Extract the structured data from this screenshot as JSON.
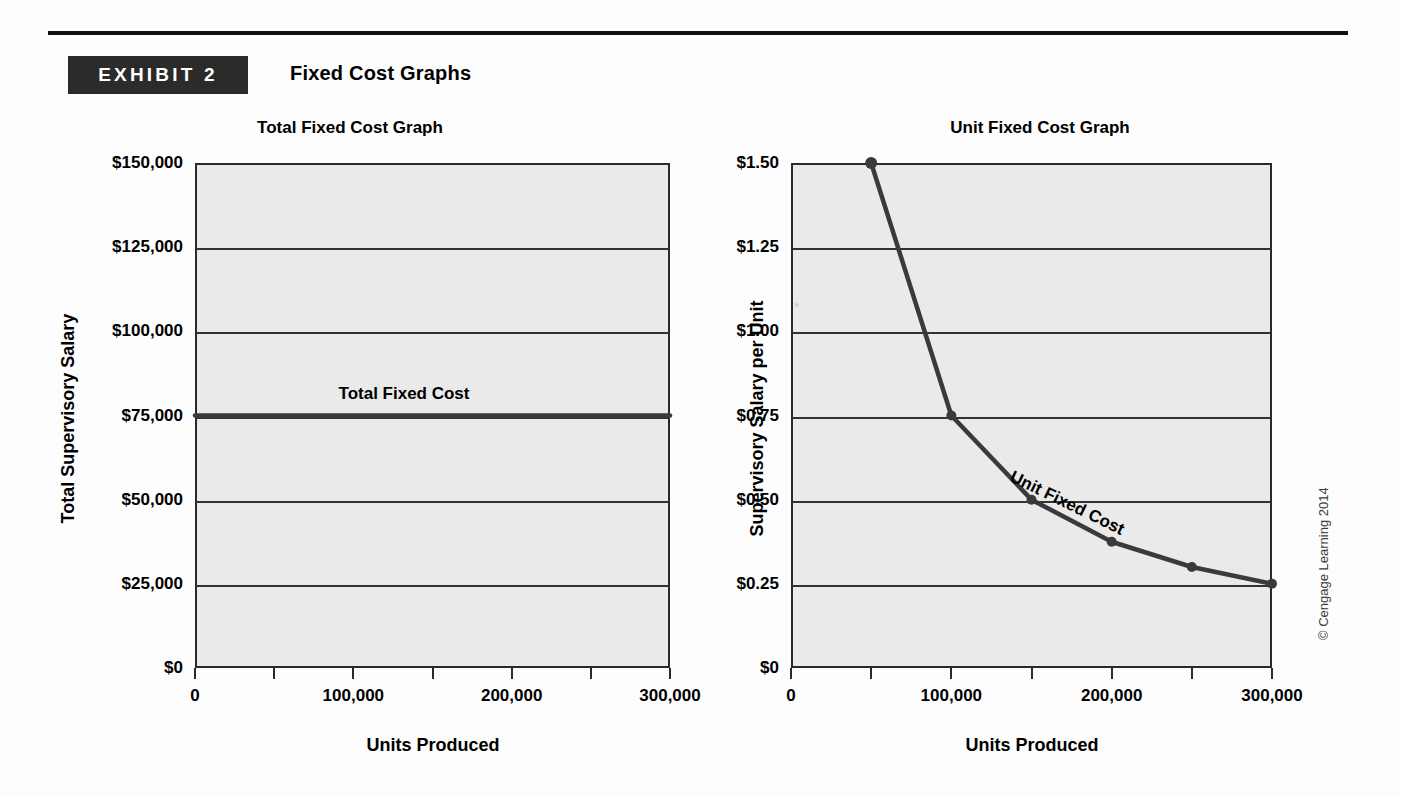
{
  "exhibit": {
    "badge_label": "EXHIBIT 2",
    "title": "Fixed Cost Graphs"
  },
  "copyright": "© Cengage Learning 2014",
  "charts": [
    {
      "title": "Total Fixed Cost Graph",
      "xlabel": "Units Produced",
      "ylabel": "Total Supervisory Salary",
      "series_label": "Total Fixed Cost",
      "y_ticks": [
        "$0",
        "$25,000",
        "$50,000",
        "$75,000",
        "$100,000",
        "$125,000",
        "$150,000"
      ],
      "x_ticks": [
        "0",
        "100,000",
        "200,000",
        "300,000"
      ]
    },
    {
      "title": "Unit Fixed Cost Graph",
      "xlabel": "Units Produced",
      "ylabel": "Supervisory Salary per Unit",
      "series_label": "Unit Fixed Cost",
      "y_ticks": [
        "$0",
        "$0.25",
        "$0.50",
        "$0.75",
        "$1.00",
        "$1.25",
        "$1.50"
      ],
      "x_ticks": [
        "0",
        "100,000",
        "200,000",
        "300,000"
      ]
    }
  ],
  "chart_data": [
    {
      "type": "line",
      "title": "Total Fixed Cost Graph",
      "xlabel": "Units Produced",
      "ylabel": "Total Supervisory Salary",
      "xlim": [
        0,
        300000
      ],
      "ylim": [
        0,
        150000
      ],
      "xticks": [
        0,
        50000,
        100000,
        150000,
        200000,
        250000,
        300000
      ],
      "xticklabels": [
        "0",
        "",
        "100,000",
        "",
        "200,000",
        "",
        "300,000"
      ],
      "yticks": [
        0,
        25000,
        50000,
        75000,
        100000,
        125000,
        150000
      ],
      "yticklabels": [
        "$0",
        "$25,000",
        "$50,000",
        "$75,000",
        "$100,000",
        "$125,000",
        "$150,000"
      ],
      "grid": true,
      "legend": "none",
      "series": [
        {
          "name": "Total Fixed Cost",
          "x": [
            0,
            300000
          ],
          "values": [
            75000,
            75000
          ],
          "markers": false,
          "annotation": "Total Fixed Cost"
        }
      ]
    },
    {
      "type": "line",
      "title": "Unit Fixed Cost Graph",
      "xlabel": "Units Produced",
      "ylabel": "Supervisory Salary per Unit",
      "xlim": [
        0,
        300000
      ],
      "ylim": [
        0,
        1.5
      ],
      "xticks": [
        0,
        50000,
        100000,
        150000,
        200000,
        250000,
        300000
      ],
      "xticklabels": [
        "0",
        "",
        "100,000",
        "",
        "200,000",
        "",
        "300,000"
      ],
      "yticks": [
        0,
        0.25,
        0.5,
        0.75,
        1.0,
        1.25,
        1.5
      ],
      "yticklabels": [
        "$0",
        "$0.25",
        "$0.50",
        "$0.75",
        "$1.00",
        "$1.25",
        "$1.50"
      ],
      "grid": true,
      "legend": "none",
      "series": [
        {
          "name": "Unit Fixed Cost",
          "x": [
            50000,
            100000,
            150000,
            200000,
            250000,
            300000
          ],
          "values": [
            1.5,
            0.75,
            0.5,
            0.375,
            0.3,
            0.25
          ],
          "markers": true,
          "annotation": "Unit Fixed Cost"
        }
      ]
    }
  ]
}
